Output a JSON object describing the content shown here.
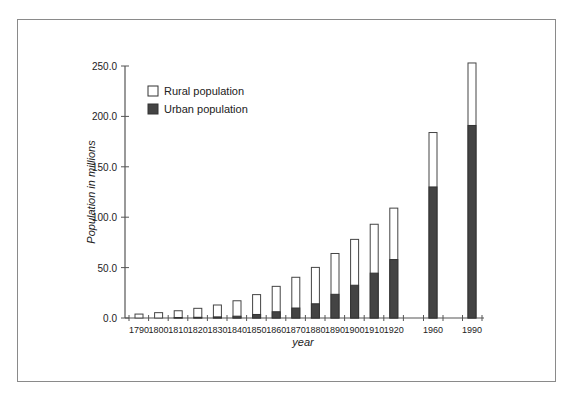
{
  "chart_data": {
    "type": "bar",
    "stacked": true,
    "title": "",
    "xlabel": "year",
    "ylabel": "Population in millions",
    "ylim": [
      0,
      250
    ],
    "yticks": [
      "0.0",
      "50.0",
      "100.0",
      "150.0",
      "200.0",
      "250.0"
    ],
    "grid": false,
    "legend_position": "upper-left",
    "categories": [
      "1790",
      "1800",
      "1810",
      "1820",
      "1830",
      "1840",
      "1850",
      "1860",
      "1870",
      "1880",
      "1890",
      "1900",
      "1910",
      "1920",
      "1960",
      "1990"
    ],
    "series": [
      {
        "name": "Urban population",
        "color": "#444444",
        "values": [
          0.2,
          0.3,
          0.5,
          0.7,
          1.1,
          1.8,
          3.5,
          6.2,
          9.9,
          14.1,
          23.5,
          32.5,
          44.5,
          58.0,
          130.0,
          191.0
        ]
      },
      {
        "name": "Rural population",
        "color": "#ffffff",
        "values": [
          3.7,
          5.0,
          6.7,
          8.9,
          11.8,
          15.3,
          19.7,
          25.2,
          30.5,
          36.1,
          40.5,
          45.5,
          48.5,
          51.0,
          54.0,
          62.0
        ]
      }
    ],
    "totals": [
      3.9,
      5.3,
      7.2,
      9.6,
      12.9,
      17.1,
      23.2,
      31.4,
      40.4,
      50.2,
      64.0,
      78.0,
      93.0,
      109.0,
      184.0,
      253.0
    ]
  },
  "legend": {
    "rural_label": "Rural population",
    "urban_label": "Urban population"
  },
  "axes": {
    "x_title": "year",
    "y_title": "Population in millions"
  }
}
